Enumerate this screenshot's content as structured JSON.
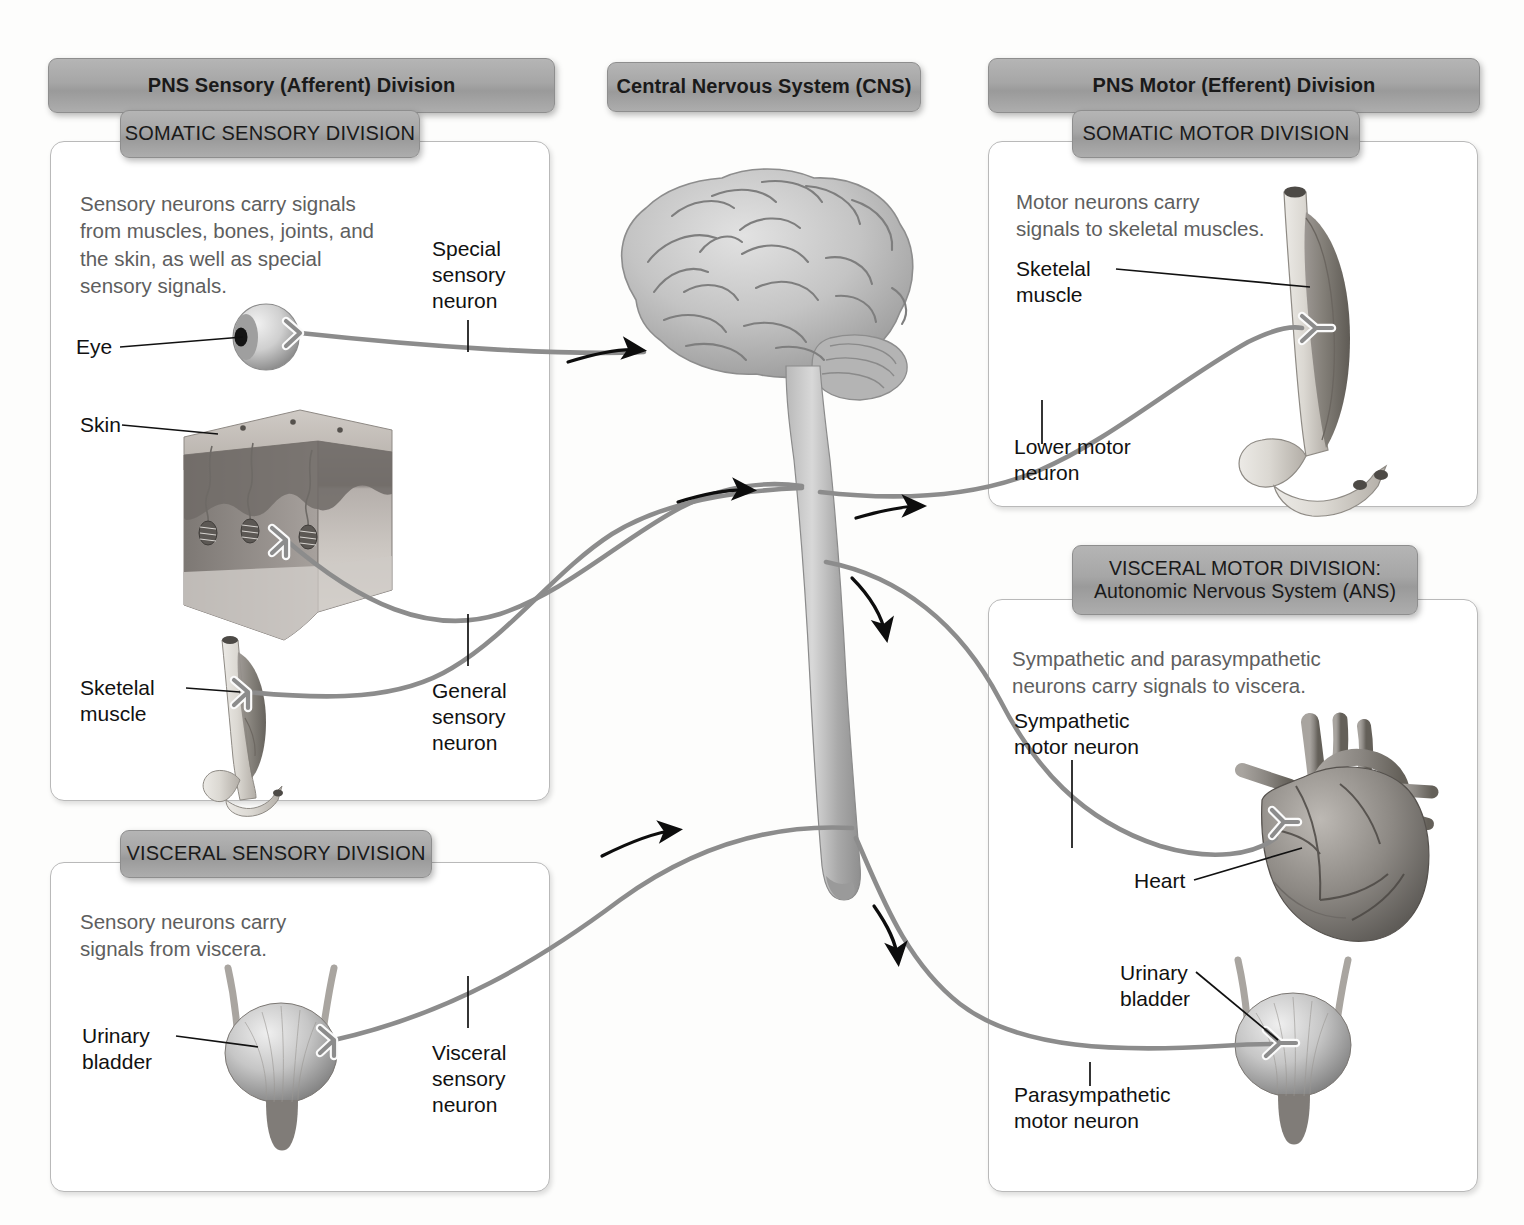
{
  "headers": {
    "pns_sensory": "PNS Sensory (Afferent) Division",
    "cns": "Central Nervous System (CNS)",
    "pns_motor": "PNS Motor (Efferent) Division",
    "somatic_sensory": "SOMATIC SENSORY DIVISION",
    "visceral_sensory": "VISCERAL SENSORY DIVISION",
    "somatic_motor": "SOMATIC MOTOR DIVISION",
    "visceral_motor_line1": "VISCERAL MOTOR DIVISION:",
    "visceral_motor_line2": "Autonomic Nervous System (ANS)"
  },
  "panels": {
    "somatic_sensory": {
      "description": "Sensory neurons carry signals\nfrom muscles, bones, joints, and\nthe skin, as well as special\nsensory signals.",
      "labels": {
        "eye": "Eye",
        "skin": "Skin",
        "skeletal_muscle": "Sketelal\nmuscle",
        "special_sensory_neuron": "Special\nsensory\nneuron",
        "general_sensory_neuron": "General\nsensory\nneuron"
      }
    },
    "visceral_sensory": {
      "description": "Sensory neurons carry\nsignals from viscera.",
      "labels": {
        "urinary_bladder": "Urinary\nbladder",
        "visceral_sensory_neuron": "Visceral\nsensory\nneuron"
      }
    },
    "somatic_motor": {
      "description": "Motor neurons carry\nsignals to skeletal muscles.",
      "labels": {
        "skeletal_muscle": "Sketelal\nmuscle",
        "lower_motor_neuron": "Lower motor\nneuron"
      }
    },
    "visceral_motor": {
      "description": "Sympathetic and parasympathetic\nneurons carry signals to viscera.",
      "labels": {
        "sympathetic_motor_neuron": "Sympathetic\nmotor neuron",
        "heart": "Heart",
        "urinary_bladder": "Urinary\nbladder",
        "parasympathetic_motor_neuron": "Parasympathetic\nmotor neuron"
      }
    }
  },
  "figures": {
    "brain": "brain-icon",
    "spinal_cord": "spinal-cord-icon",
    "eye": "eyeball-icon",
    "skin": "skin-block-icon",
    "skeletal_muscle_left": "skeletal-muscle-icon",
    "skeletal_muscle_right": "skeletal-muscle-icon",
    "bladder_left": "urinary-bladder-icon",
    "bladder_right": "urinary-bladder-icon",
    "heart": "heart-icon"
  },
  "colors": {
    "chip_gray": "#a6a6a6",
    "nerve_gray": "#8c8c8c",
    "panel_border": "#b9b9b9",
    "body_text": "#5e5e5e",
    "label_text": "#111111",
    "arrow_black": "#0d0d0d"
  }
}
